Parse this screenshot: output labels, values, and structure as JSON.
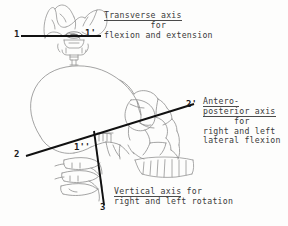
{
  "figure": {
    "background_color": "#fdfdfc",
    "ink_color": "#4a4a4a",
    "axis_line_color": "#111111",
    "text_color": "#3a3a3a",
    "width": 288,
    "height": 226
  },
  "captions": {
    "transverse": {
      "line1": "Transverse axis",
      "line2": "for",
      "line3": "flexion and extension"
    },
    "anteroposterior": {
      "line1": "Antero-",
      "line2": "posterior axis",
      "line3": "for",
      "line4": "right and left",
      "line5": "lateral flexion"
    },
    "vertical": {
      "line1": "Vertical axis",
      "line2": "for",
      "line3": "right and left rotation"
    }
  },
  "axis_labels": {
    "transverse_left": "1",
    "transverse_right": "1'",
    "transverse_lateral": "1''",
    "ap_left": "2",
    "ap_right": "2'",
    "vertical_bottom": "3"
  },
  "drawings": {
    "top_view": "posterior-view-skull-base-with-atlas",
    "lateral_view": "lateral-skull-and-cervical-spine"
  }
}
